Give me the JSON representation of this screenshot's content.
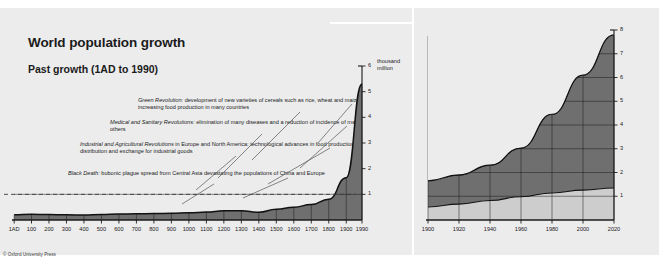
{
  "page": {
    "background": "#ececed",
    "footer": "© Oxford University Press"
  },
  "colors": {
    "developing": "#6f6f6f",
    "developed": "#cdcdcd",
    "panel_bg": "#ececed",
    "axis": "#1b1b1b",
    "leader_line": "#555555"
  },
  "left_panel": {
    "title": "World population growth",
    "subtitle": "Past growth (1AD to 1990)",
    "unit_line1": "thousand",
    "unit_line2": "million",
    "annotations": [
      {
        "name": "green-revolution",
        "term": "Green Revolution:",
        "text": " development of new varieties of cereals such as rice, wheat and maize increasing food production in many countries"
      },
      {
        "name": "medical-sanitary",
        "term": "Medical and Sanitary Revolutions:",
        "text": " elimination of many diseases and a reduction of incidence of many others"
      },
      {
        "name": "industrial-agricultural",
        "term": "Industrial and Agricultural Revolutions",
        "text": " in Europe and North America: technological advances in food production, distribution and exchange for industrial goods"
      },
      {
        "name": "black-death",
        "term": "Black Death:",
        "text": " bubonic plague spread from Central Asia devastating the populations of China and Europe"
      }
    ]
  },
  "right_panel": {
    "title_line1": "Recent growth (1900 to 1990),",
    "title_line2": "projected to the year 2020",
    "unit_line1": "thousand",
    "unit_line2": "million",
    "legend": [
      {
        "label": "developing regions",
        "color": "#6f6f6f"
      },
      {
        "label": "developed regions",
        "color": "#cdcdcd"
      }
    ]
  },
  "chart_data": [
    {
      "type": "area",
      "name": "past-growth-chart",
      "title": "Past growth (1AD to 1990)",
      "xlabel": "",
      "ylabel": "thousand million",
      "xlim": [
        0,
        1990
      ],
      "ylim": [
        0,
        6
      ],
      "grid": true,
      "dashed_reference_line": 1,
      "xticklabels": [
        "1AD",
        "100",
        "200",
        "300",
        "400",
        "500",
        "600",
        "700",
        "800",
        "900",
        "1000",
        "1100",
        "1200",
        "1300",
        "1400",
        "1500",
        "1600",
        "1700",
        "1800",
        "1900",
        "1990"
      ],
      "yticklabels": [
        "1",
        "2",
        "3",
        "4",
        "5",
        "6"
      ],
      "x": [
        1,
        100,
        200,
        300,
        400,
        500,
        600,
        700,
        800,
        900,
        1000,
        1100,
        1200,
        1300,
        1400,
        1500,
        1600,
        1700,
        1800,
        1900,
        1990
      ],
      "values": [
        0.2,
        0.22,
        0.21,
        0.2,
        0.19,
        0.21,
        0.23,
        0.24,
        0.25,
        0.26,
        0.28,
        0.31,
        0.36,
        0.36,
        0.3,
        0.42,
        0.5,
        0.6,
        0.81,
        1.65,
        5.3
      ],
      "series_label": "World population"
    },
    {
      "type": "area",
      "name": "recent-growth-chart",
      "stacked": true,
      "title": "Recent growth (1900 to 1990), projected to the year 2020",
      "xlabel": "",
      "ylabel": "thousand million",
      "xlim": [
        1900,
        2020
      ],
      "ylim": [
        0,
        8
      ],
      "grid": true,
      "xticklabels": [
        "1900",
        "1920",
        "1940",
        "1960",
        "1980",
        "2000",
        "2020"
      ],
      "yticklabels": [
        "1",
        "2",
        "3",
        "4",
        "5",
        "6",
        "7",
        "8"
      ],
      "x": [
        1900,
        1920,
        1940,
        1960,
        1980,
        2000,
        2020
      ],
      "series": [
        {
          "name": "developed regions",
          "color": "#cdcdcd",
          "values": [
            0.55,
            0.67,
            0.82,
            0.98,
            1.14,
            1.26,
            1.35
          ]
        },
        {
          "name": "developing regions",
          "color": "#6f6f6f",
          "values": [
            1.1,
            1.23,
            1.49,
            2.05,
            3.31,
            4.84,
            6.45
          ]
        }
      ],
      "totals": [
        1.65,
        1.9,
        2.31,
        3.03,
        4.45,
        6.1,
        7.8
      ]
    }
  ]
}
